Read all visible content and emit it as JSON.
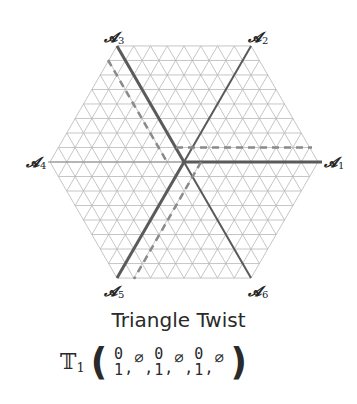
{
  "diagram": {
    "center": [
      184,
      162
    ],
    "hex_radius": 134,
    "grid_divisions": 8,
    "axes": [
      {
        "id": "A1",
        "label": "𝓐",
        "index": "1",
        "pos": [
          324,
          155
        ]
      },
      {
        "id": "A2",
        "label": "𝓐",
        "index": "2",
        "pos": [
          248,
          30
        ]
      },
      {
        "id": "A3",
        "label": "𝓐",
        "index": "3",
        "pos": [
          104,
          30
        ]
      },
      {
        "id": "A4",
        "label": "𝓐",
        "index": "4",
        "pos": [
          26,
          155
        ]
      },
      {
        "id": "A5",
        "label": "𝓐",
        "index": "5",
        "pos": [
          104,
          284
        ]
      },
      {
        "id": "A6",
        "label": "𝓐",
        "index": "6",
        "pos": [
          248,
          284
        ]
      }
    ],
    "colors": {
      "grid": "#b8b8b8",
      "thick": "#5a5a5a",
      "dashed": "#8a8a8a",
      "text": "#2a2a2a"
    }
  },
  "title": "Triangle Twist",
  "formula": {
    "operator": "𝕋",
    "operator_index": "1",
    "open": "(",
    "close": ")",
    "terms": [
      {
        "type": "stack",
        "top": "0",
        "bottom": "1"
      },
      {
        "type": "empty",
        "value": "∅"
      },
      {
        "type": "stack",
        "top": "0",
        "bottom": "1"
      },
      {
        "type": "empty",
        "value": "∅"
      },
      {
        "type": "stack",
        "top": "0",
        "bottom": "1"
      },
      {
        "type": "empty",
        "value": "∅"
      }
    ],
    "separator": ","
  }
}
